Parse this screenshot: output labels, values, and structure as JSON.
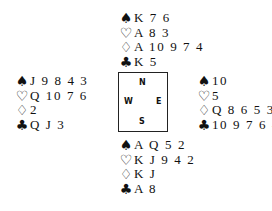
{
  "hands": {
    "north": {
      "spades": "K 7 6",
      "hearts": "A 8 3",
      "diamonds": "A 10 9 7 4",
      "clubs": "K 5"
    },
    "west": {
      "spades": "J 9 8 4 3",
      "hearts": "Q 10 7 6",
      "diamonds": "2",
      "clubs": "Q J 3"
    },
    "east": {
      "spades": "10",
      "hearts": "5",
      "diamonds": "Q 8 6 5 3",
      "clubs": "10 9 7 6 4 2"
    },
    "south": {
      "spades": "A Q 5 2",
      "hearts": "K J 9 4 2",
      "diamonds": "K J",
      "clubs": "A 8"
    }
  },
  "suits": {
    "spades": "♠",
    "hearts": "♡",
    "diamonds": "♢",
    "clubs": "♣"
  },
  "compass": {
    "n": "N",
    "w": "W",
    "e": "E",
    "s": "S"
  }
}
